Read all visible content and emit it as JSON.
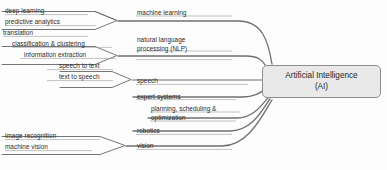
{
  "diagram": {
    "root": {
      "line1": "Artificial Intelligence",
      "line2": "(AI)"
    },
    "branches": [
      {
        "name": "machine learning",
        "label": "machine learning",
        "leaves": [
          {
            "label": "deep learning"
          },
          {
            "label": "predictive analytics"
          }
        ]
      },
      {
        "name": "natural language processing",
        "label_line1": "natural language",
        "label_line2": "processing (NLP)",
        "leaves": [
          {
            "label": "translation"
          },
          {
            "label": "classification & clustering"
          },
          {
            "label": "information extraction"
          }
        ]
      },
      {
        "name": "speech",
        "label": "speech",
        "leaves": [
          {
            "label": "speech to text"
          },
          {
            "label": "text to speech"
          }
        ]
      },
      {
        "name": "expert systems",
        "label": "expert systems",
        "leaves": []
      },
      {
        "name": "planning scheduling optimization",
        "label_line1": "planning, scheduling &",
        "label_line2": "optimization",
        "leaves": []
      },
      {
        "name": "robotics",
        "label": "robotics",
        "leaves": []
      },
      {
        "name": "vision",
        "label": "vision",
        "leaves": [
          {
            "label": "image recognition"
          },
          {
            "label": "machine vision"
          }
        ]
      }
    ],
    "colors": {
      "line": "#6f6f6f",
      "underline": "#9a9a9a",
      "box_fill": "#e9e9e9",
      "box_border": "#8d8d8d",
      "text": "#2b2b2b",
      "background": "#fdfdfd"
    }
  }
}
